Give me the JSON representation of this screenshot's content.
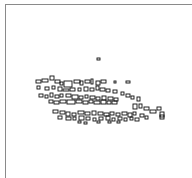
{
  "map": {
    "frame_color": "#8a8a8a",
    "stroke_color": "#111111",
    "background": "#ffffff",
    "buildings": [
      [
        97,
        58,
        3,
        2
      ],
      [
        36,
        80,
        5,
        3
      ],
      [
        42,
        79,
        6,
        3
      ],
      [
        50,
        76,
        4,
        4
      ],
      [
        55,
        80,
        5,
        3
      ],
      [
        60,
        82,
        3,
        3
      ],
      [
        64,
        81,
        8,
        6
      ],
      [
        74,
        80,
        6,
        3
      ],
      [
        80,
        81,
        3,
        4
      ],
      [
        85,
        80,
        5,
        3
      ],
      [
        91,
        79,
        2,
        5
      ],
      [
        96,
        81,
        4,
        4
      ],
      [
        101,
        80,
        5,
        3
      ],
      [
        114,
        81,
        2,
        2
      ],
      [
        126,
        81,
        4,
        2
      ],
      [
        37,
        86,
        3,
        3
      ],
      [
        45,
        87,
        4,
        3
      ],
      [
        52,
        86,
        3,
        3
      ],
      [
        58,
        87,
        4,
        4
      ],
      [
        63,
        89,
        6,
        2
      ],
      [
        70,
        88,
        5,
        3
      ],
      [
        78,
        88,
        3,
        3
      ],
      [
        84,
        87,
        4,
        4
      ],
      [
        90,
        88,
        4,
        3
      ],
      [
        96,
        86,
        3,
        4
      ],
      [
        100,
        88,
        5,
        3
      ],
      [
        106,
        89,
        4,
        3
      ],
      [
        113,
        90,
        4,
        3
      ],
      [
        121,
        92,
        3,
        3
      ],
      [
        126,
        94,
        4,
        3
      ],
      [
        131,
        96,
        3,
        3
      ],
      [
        137,
        97,
        3,
        4
      ],
      [
        39,
        94,
        4,
        3
      ],
      [
        45,
        95,
        3,
        3
      ],
      [
        50,
        93,
        3,
        4
      ],
      [
        55,
        95,
        4,
        3
      ],
      [
        60,
        94,
        3,
        3
      ],
      [
        66,
        94,
        5,
        3
      ],
      [
        72,
        95,
        6,
        4
      ],
      [
        79,
        96,
        4,
        3
      ],
      [
        85,
        95,
        3,
        3
      ],
      [
        90,
        96,
        5,
        3
      ],
      [
        96,
        97,
        4,
        3
      ],
      [
        102,
        96,
        4,
        4
      ],
      [
        108,
        97,
        5,
        3
      ],
      [
        114,
        98,
        4,
        3
      ],
      [
        49,
        100,
        4,
        3
      ],
      [
        54,
        101,
        5,
        3
      ],
      [
        60,
        100,
        6,
        3
      ],
      [
        67,
        100,
        8,
        4
      ],
      [
        76,
        100,
        6,
        3
      ],
      [
        83,
        101,
        5,
        3
      ],
      [
        89,
        100,
        4,
        3
      ],
      [
        94,
        101,
        6,
        3
      ],
      [
        101,
        100,
        5,
        4
      ],
      [
        107,
        101,
        4,
        3
      ],
      [
        112,
        101,
        5,
        3
      ],
      [
        133,
        104,
        4,
        5
      ],
      [
        139,
        104,
        3,
        4
      ],
      [
        144,
        107,
        5,
        3
      ],
      [
        150,
        110,
        6,
        3
      ],
      [
        157,
        107,
        4,
        3
      ],
      [
        160,
        112,
        4,
        5
      ],
      [
        53,
        110,
        5,
        3
      ],
      [
        60,
        111,
        5,
        3
      ],
      [
        66,
        112,
        4,
        4
      ],
      [
        72,
        113,
        4,
        3
      ],
      [
        78,
        111,
        6,
        3
      ],
      [
        85,
        112,
        5,
        3
      ],
      [
        92,
        111,
        4,
        4
      ],
      [
        98,
        112,
        5,
        3
      ],
      [
        104,
        113,
        5,
        3
      ],
      [
        110,
        112,
        4,
        3
      ],
      [
        116,
        113,
        4,
        3
      ],
      [
        122,
        112,
        5,
        3
      ],
      [
        128,
        113,
        4,
        4
      ],
      [
        133,
        112,
        3,
        3
      ],
      [
        140,
        114,
        4,
        3
      ],
      [
        145,
        116,
        3,
        3
      ],
      [
        160,
        115,
        4,
        4
      ],
      [
        58,
        116,
        4,
        3
      ],
      [
        66,
        117,
        5,
        3
      ],
      [
        73,
        117,
        3,
        3
      ],
      [
        79,
        116,
        5,
        4
      ],
      [
        86,
        117,
        4,
        3
      ],
      [
        93,
        118,
        3,
        3
      ],
      [
        99,
        117,
        4,
        3
      ],
      [
        106,
        116,
        4,
        4
      ],
      [
        112,
        118,
        3,
        3
      ],
      [
        118,
        117,
        4,
        3
      ],
      [
        124,
        118,
        3,
        3
      ],
      [
        130,
        117,
        3,
        3
      ],
      [
        135,
        118,
        4,
        3
      ],
      [
        78,
        121,
        3,
        2
      ],
      [
        84,
        122,
        3,
        2
      ],
      [
        97,
        121,
        3,
        2
      ],
      [
        108,
        121,
        3,
        2
      ],
      [
        117,
        121,
        3,
        2
      ]
    ]
  }
}
